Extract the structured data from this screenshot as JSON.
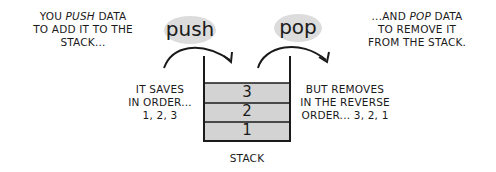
{
  "captions": {
    "push_line1": "YOU",
    "push_word": "PUSH",
    "push_line1_rest": "DATA",
    "push_line2": "TO ADD IT TO THE",
    "push_line3": "STACK...",
    "pop_line1_pre": "...AND",
    "pop_word": "POP",
    "pop_line1_rest": "DATA",
    "pop_line2": "TO REMOVE IT",
    "pop_line3": "FROM THE STACK.",
    "saves_line1": "IT SAVES",
    "saves_line2": "IN ORDER...",
    "saves_line3": "1, 2, 3",
    "removes_line1": "BUT REMOVES",
    "removes_line2": "IN THE REVERSE",
    "removes_line3": "ORDER... 3, 2, 1",
    "stack_label": "STACK"
  },
  "bubbles": {
    "push": "push",
    "pop": "pop"
  },
  "stack": {
    "cells": [
      "3",
      "2",
      "1"
    ]
  },
  "colors": {
    "cell_fill": "#d3d3d3",
    "bubble_fill": "#dcdcdc",
    "ink": "#1a1a1a"
  }
}
